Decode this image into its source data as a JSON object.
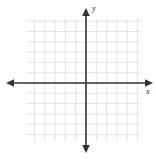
{
  "figure": {
    "title": "",
    "width": 156,
    "height": 159,
    "background_color": "#ffffff"
  },
  "axes": {
    "x_label": "x",
    "y_label": "y",
    "axis_color": "#333333",
    "axis_line_width": 1.6,
    "arrowheads": [
      "left",
      "right",
      "up",
      "down"
    ],
    "origin": {
      "x": 86,
      "y": 83
    }
  },
  "grid": {
    "show": true,
    "color": "#d8d8d8",
    "line_width": 0.7,
    "spacing_px": 10.3,
    "left": 27,
    "top": 19,
    "right": 140,
    "bottom": 141,
    "columns": 11,
    "rows": 12
  },
  "chart_data": {
    "type": "scatter",
    "title": "",
    "xlabel": "x",
    "ylabel": "y",
    "x": [],
    "y": [],
    "series": [],
    "categories": [],
    "values": [],
    "xlim": [
      -6,
      5
    ],
    "ylim": [
      -6,
      6
    ],
    "x_tick_labels": [],
    "y_tick_labels": [],
    "grid": true,
    "legend": false,
    "legend_position": "none",
    "annotations": [],
    "note": "Empty Cartesian coordinate plane: light gray square grid with dark x- and y-axes drawn through the origin, each terminating in arrowheads. No plotted data points, curves, tick-mark numbers, or legend are present."
  }
}
